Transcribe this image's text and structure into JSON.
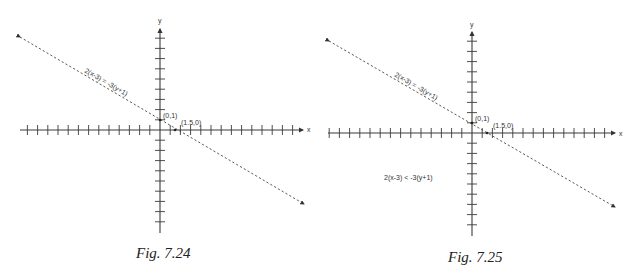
{
  "figures": [
    {
      "caption": "Fig. 7.24",
      "x_axis_label": "x",
      "y_axis_label": "y",
      "line_label": "2(x-3) = -3(y+1)",
      "point_y_intercept": "(0,1)",
      "point_x_intercept": "(1.5,0)",
      "region_label": ""
    },
    {
      "caption": "Fig. 7.25",
      "x_axis_label": "x",
      "y_axis_label": "y",
      "line_label": "2(x-3) = -3(y+1)",
      "point_y_intercept": "(0,1)",
      "point_x_intercept": "(1.5,0)",
      "region_label": "2(x-3) < -3(y+1)"
    }
  ],
  "colors": {
    "axis": "#3a3a3a",
    "line": "#444444",
    "background": "#ffffff"
  }
}
